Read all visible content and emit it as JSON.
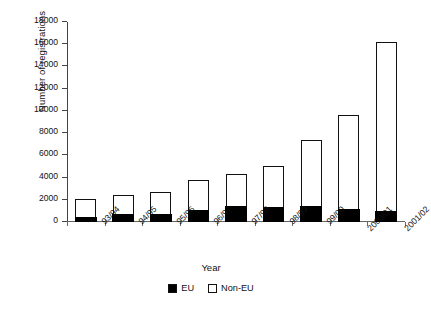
{
  "chart_data": {
    "type": "bar",
    "stacked": true,
    "title": "",
    "xlabel": "Year",
    "ylabel": "Number of registrations",
    "categories": [
      "93/94",
      "94/95",
      "95/96",
      "96/97",
      "97/98",
      "98/99",
      "99/00",
      "2000/01",
      "2001/02"
    ],
    "series": [
      {
        "name": "EU",
        "color": "#000000",
        "values": [
          500,
          800,
          800,
          1150,
          1450,
          1400,
          1450,
          1250,
          1050
        ]
      },
      {
        "name": "Non-EU",
        "color": "#ffffff",
        "values": [
          1570,
          1600,
          1900,
          2600,
          2850,
          3600,
          5950,
          8400,
          15150
        ]
      }
    ],
    "totals": [
      2070,
      2400,
      2700,
      3750,
      4300,
      5000,
      7400,
      9650,
      16200
    ],
    "ylim": [
      0,
      18000
    ],
    "yticks": [
      0,
      2000,
      4000,
      6000,
      8000,
      10000,
      12000,
      14000,
      16000,
      18000
    ],
    "ytick_labels": [
      "0",
      "2000",
      "4000",
      "6000",
      "8000",
      "10000",
      "12000",
      "14000",
      "16000",
      "18000"
    ],
    "grid": false,
    "legend_position": "bottom",
    "legend_entries": [
      "EU",
      "Non-EU"
    ]
  },
  "legend": {
    "eu_label": "EU",
    "non_eu_label": "Non-EU"
  }
}
